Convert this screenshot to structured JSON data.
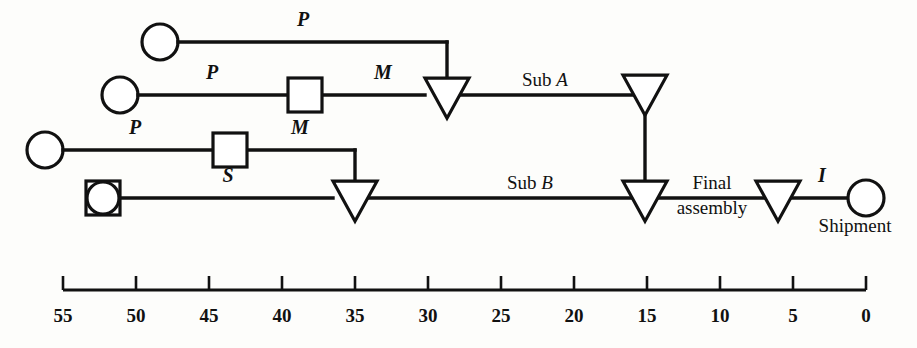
{
  "diagram": {
    "background_color": "#fdfdfb",
    "line_color": "#111111",
    "shape_fill": "#ffffff"
  },
  "rows": [
    {
      "id": "row-1",
      "y": 42,
      "start_symbol": "circle",
      "start_x": 160,
      "segments": [
        {
          "label": "P",
          "italic": true,
          "label_x": 303,
          "label_y": 26
        }
      ],
      "end_x": 447,
      "drop_to_y": 80
    },
    {
      "id": "row-2",
      "y": 95,
      "start_symbol": "circle",
      "start_x": 120,
      "segments": [
        {
          "label": "P",
          "italic": true,
          "label_x": 212,
          "label_y": 79
        },
        {
          "label": "M",
          "italic": true,
          "label_x": 383,
          "label_y": 79
        }
      ],
      "square_x": 305,
      "triangle_x": 447,
      "after_label": "Sub A",
      "after_label_x": 545,
      "after_label_y": 86,
      "end_triangle_x": 645
    },
    {
      "id": "row-3",
      "y": 150,
      "start_symbol": "circle",
      "start_x": 45,
      "segments": [
        {
          "label": "P",
          "italic": true,
          "label_x": 135,
          "label_y": 134
        },
        {
          "label": "M",
          "italic": true,
          "label_x": 300,
          "label_y": 134
        }
      ],
      "square_x": 230,
      "end_x": 355,
      "drop_to_y": 184
    },
    {
      "id": "row-4",
      "y": 198,
      "start_symbol": "circle-in-square",
      "start_x": 103,
      "segments": [
        {
          "label": "S",
          "italic": true,
          "label_x": 228,
          "label_y": 182
        }
      ],
      "triangle_x": 355,
      "after_label": "Sub B",
      "after_label_x": 530,
      "after_label_y": 189,
      "junction_triangle_x": 645,
      "final_label_line1": "Final",
      "final_label_line2": "assembly",
      "final_label_x": 712,
      "final_label_y1": 189,
      "final_label_y2": 214,
      "inspect_triangle_x": 778,
      "inspect_label": "I",
      "inspect_label_x": 822,
      "inspect_label_y": 182,
      "end_symbol": "circle",
      "end_x": 866,
      "end_label": "Shipment",
      "end_label_x": 855,
      "end_label_y": 232
    }
  ],
  "symbols": {
    "circle_radius": 18,
    "square_size": 34,
    "triangle_width": 44,
    "triangle_height": 40,
    "legend": {
      "circle": "operation",
      "square": "storage",
      "triangle": "inventory-point",
      "circle-in-square": "operation-with-storage"
    }
  },
  "axis": {
    "type": "time-scale",
    "orientation": "reversed",
    "y": 290,
    "x_left": 63,
    "x_right": 866,
    "tick_height": 14,
    "label_y": 322,
    "ticks": [
      55,
      50,
      45,
      40,
      35,
      30,
      25,
      20,
      15,
      10,
      5,
      0
    ],
    "tick_labels": [
      "55",
      "50",
      "45",
      "40",
      "35",
      "30",
      "25",
      "20",
      "15",
      "10",
      "5",
      "0"
    ],
    "min": 0,
    "max": 55
  }
}
